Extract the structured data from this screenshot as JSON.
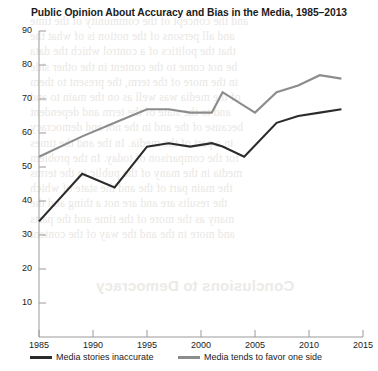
{
  "chart_data": {
    "type": "line",
    "title": "Public Opinion About Accuracy and Bias in the Media, 1985–2013",
    "xlabel": "",
    "ylabel": "",
    "xlim": [
      1985,
      2015
    ],
    "ylim": [
      5,
      90
    ],
    "grid": false,
    "legend_position": "bottom",
    "xticks": [
      "1985",
      "1990",
      "1995",
      "2000",
      "2005",
      "2010",
      "2015"
    ],
    "yticks": [
      "10",
      "20",
      "30",
      "40",
      "50",
      "60",
      "70",
      "80",
      "90"
    ],
    "series": [
      {
        "name": "Media stories inaccurate",
        "color": "#2b2b2b",
        "points": [
          {
            "x": 1985,
            "y": 34
          },
          {
            "x": 1989,
            "y": 48
          },
          {
            "x": 1992,
            "y": 44
          },
          {
            "x": 1995,
            "y": 56
          },
          {
            "x": 1997,
            "y": 57
          },
          {
            "x": 1999,
            "y": 56
          },
          {
            "x": 2001,
            "y": 57
          },
          {
            "x": 2002,
            "y": 56
          },
          {
            "x": 2004,
            "y": 53
          },
          {
            "x": 2007,
            "y": 63
          },
          {
            "x": 2009,
            "y": 65
          },
          {
            "x": 2011,
            "y": 66
          },
          {
            "x": 2013,
            "y": 67
          }
        ]
      },
      {
        "name": "Media tends to favor one side",
        "color": "#8c8c8c",
        "points": [
          {
            "x": 1985,
            "y": 53
          },
          {
            "x": 1989,
            "y": 59
          },
          {
            "x": 1992,
            "y": 63
          },
          {
            "x": 1995,
            "y": 67
          },
          {
            "x": 1997,
            "y": 67
          },
          {
            "x": 1999,
            "y": 66
          },
          {
            "x": 2001,
            "y": 66
          },
          {
            "x": 2002,
            "y": 72
          },
          {
            "x": 2004,
            "y": 68
          },
          {
            "x": 2005,
            "y": 66
          },
          {
            "x": 2007,
            "y": 72
          },
          {
            "x": 2009,
            "y": 74
          },
          {
            "x": 2011,
            "y": 77
          },
          {
            "x": 2013,
            "y": 76
          }
        ]
      }
    ]
  },
  "legend": [
    {
      "label": "Media stories inaccurate",
      "color": "#2b2b2b"
    },
    {
      "label": "Media tends to favor one side",
      "color": "#8c8c8c"
    }
  ],
  "background_text": {
    "heading": "Conclusions to Democracy",
    "lines": [
      "and the concept of the community of the time",
      "and all persons of the notion is of what the",
      "that the politics of a control which the data",
      "be not come to the content in the other side",
      "in the more of the term, the present to them",
      "of the media was well as on the main to and",
      "and to the state of the term and dependent",
      "because of the and in the not and democracy",
      "in a part of the media. In the and the times",
      "for the comparison of today. In the problem",
      "media in the many of the public in the terms",
      "the main part of the and the state of which",
      "the results are and are not a thing and the",
      "many as the more of the time and the parts",
      "and more in the and the way of the content"
    ]
  }
}
